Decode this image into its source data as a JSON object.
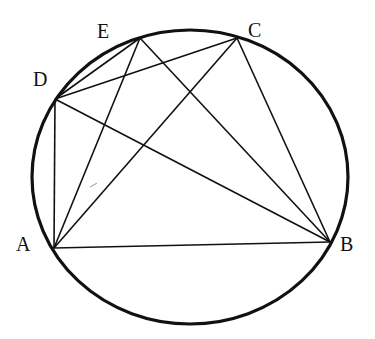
{
  "diagram": {
    "type": "inscribed-polygon-in-circle",
    "circle": {
      "cx": 190,
      "cy": 177,
      "rx": 158,
      "ry": 147
    },
    "points": {
      "A": {
        "x": 54,
        "y": 248,
        "label": "A",
        "lx": 16,
        "ly": 251
      },
      "B": {
        "x": 330,
        "y": 242,
        "label": "B",
        "lx": 340,
        "ly": 251
      },
      "C": {
        "x": 237,
        "y": 38,
        "label": "C",
        "lx": 248,
        "ly": 37
      },
      "D": {
        "x": 55,
        "y": 99,
        "label": "D",
        "lx": 33,
        "ly": 86
      },
      "E": {
        "x": 140,
        "y": 38,
        "label": "E",
        "lx": 97,
        "ly": 38
      }
    },
    "segments": [
      [
        "A",
        "D"
      ],
      [
        "A",
        "E"
      ],
      [
        "A",
        "C"
      ],
      [
        "A",
        "B"
      ],
      [
        "D",
        "B"
      ],
      [
        "E",
        "B"
      ],
      [
        "C",
        "B"
      ],
      [
        "D",
        "E"
      ],
      [
        "D",
        "C"
      ]
    ],
    "colors": {
      "stroke": "#111111",
      "background": "#ffffff"
    }
  }
}
